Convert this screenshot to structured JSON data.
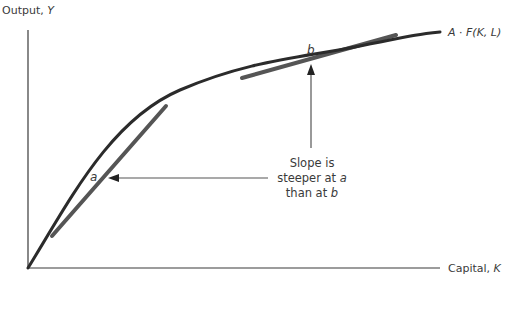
{
  "diagram": {
    "y_axis_label": {
      "text": "Output, ",
      "var": "Y"
    },
    "x_axis_label": {
      "text": "Capital, ",
      "var": "K"
    },
    "curve_label": {
      "prefix": "A",
      "dot": " · ",
      "func": "F(K, L)"
    },
    "point_a": "a",
    "point_b": "b",
    "annotation": {
      "line1": "Slope is",
      "line2_text": "steeper at ",
      "line2_var": "a",
      "line3_text": "than at ",
      "line3_var": "b"
    },
    "colors": {
      "curve": "#2b2b2b",
      "tangent": "#555555",
      "axis": "#3a3a3a",
      "arrow": "#555555",
      "text": "#3a3a3a"
    }
  }
}
